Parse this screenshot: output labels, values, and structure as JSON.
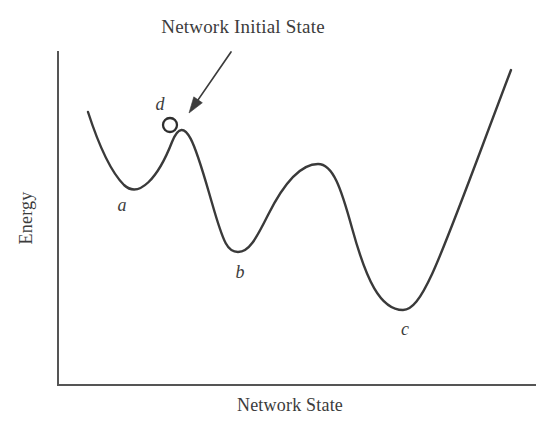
{
  "figure": {
    "annotation": {
      "text": "Network Initial State",
      "x": 243,
      "y": 33
    },
    "axes": {
      "x_label": "Network State",
      "y_label": "Energy",
      "x_axis": {
        "x1": 58,
        "y1": 385,
        "x2": 535,
        "y2": 385
      },
      "y_axis": {
        "x1": 58,
        "y1": 52,
        "x2": 58,
        "y2": 385
      },
      "axis_color": "#555555"
    },
    "curve": {
      "color": "#3a3a3a",
      "stroke_width": 2.4,
      "path": "M 88 112 C 99 146 110 171 124 185 C 139 199 158 178 172 142 C 186 107 198 155 212 203 C 224 245 228 252 238 252 C 249 252 256 239 268 215 C 285 181 302 164 318 164 C 333 164 341 188 352 228 C 366 279 380 310 403 310 C 424 310 442 252 511 70"
    },
    "marker": {
      "label": "d",
      "label_x": 160,
      "label_y": 110,
      "circle_x": 170,
      "circle_y": 125,
      "circle_r": 7,
      "color": "#2e2e2e"
    },
    "pointer": {
      "tail_x": 231,
      "tail_y": 52,
      "tip_x": 189,
      "tip_y": 113,
      "color": "#3c3c3c"
    },
    "state_labels": [
      {
        "text": "a",
        "x": 122,
        "y": 211
      },
      {
        "text": "b",
        "x": 240,
        "y": 278
      },
      {
        "text": "c",
        "x": 405,
        "y": 335
      },
      {
        "text": "d",
        "x": 160,
        "y": 110
      }
    ]
  },
  "chart_data": {
    "type": "line",
    "title": "Network Initial State",
    "xlabel": "Network State",
    "ylabel": "Energy",
    "grid": false,
    "legend": false,
    "axis_ticks": [],
    "series": [
      {
        "name": "Energy landscape",
        "x": [
          88,
          124,
          172,
          238,
          318,
          403,
          511
        ],
        "y": [
          112,
          185,
          142,
          252,
          164,
          310,
          70
        ]
      }
    ],
    "annotations": [
      {
        "label": "a",
        "type": "local-minimum",
        "x": 124,
        "y": 185
      },
      {
        "label": "b",
        "type": "local-minimum",
        "x": 238,
        "y": 252
      },
      {
        "label": "c",
        "type": "global-minimum",
        "x": 403,
        "y": 310
      },
      {
        "label": "d",
        "type": "initial-state-marker",
        "x": 170,
        "y": 125
      },
      {
        "label": "Network Initial State",
        "type": "arrow-callout",
        "x": 189,
        "y": 113
      }
    ]
  }
}
